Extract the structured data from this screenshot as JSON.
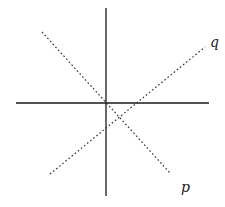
{
  "diagram": {
    "type": "line-diagram",
    "axes": {
      "vertical": {
        "x1": 106,
        "y1": 8,
        "x2": 106,
        "y2": 196,
        "style": "solid"
      },
      "horizontal": {
        "x1": 16,
        "y1": 103,
        "x2": 209,
        "y2": 103,
        "style": "solid"
      }
    },
    "lines": [
      {
        "id": "p",
        "label": "p",
        "x1": 42,
        "y1": 32,
        "x2": 170,
        "y2": 173,
        "style": "dotted",
        "label_pos": {
          "x": 181,
          "y": 192
        }
      },
      {
        "id": "q",
        "label": "q",
        "x1": 50,
        "y1": 174,
        "x2": 205,
        "y2": 47,
        "style": "dotted",
        "label_pos": {
          "x": 210,
          "y": 47
        }
      }
    ],
    "colors": {
      "axis": "#1a1a1a",
      "line": "#333333",
      "background": "#ffffff"
    }
  },
  "labels": {
    "p": "p",
    "q": "q"
  }
}
